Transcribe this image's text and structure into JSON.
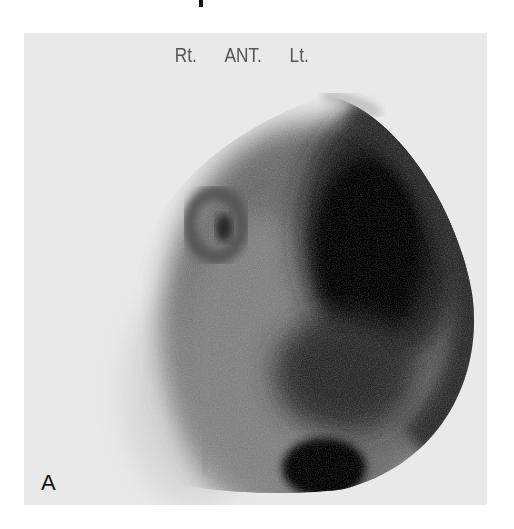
{
  "figure": {
    "orientation_labels": {
      "right": "Rt.",
      "view": "ANT.",
      "left": "Lt."
    },
    "panel_letter": "A",
    "colors": {
      "background": "#ffffff",
      "panel": "#e9e9e9",
      "uptake_dark": "#0a0a0a",
      "label_text": "#555555"
    }
  }
}
